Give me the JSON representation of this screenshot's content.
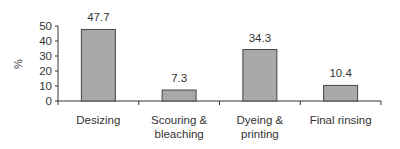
{
  "chart_data": {
    "type": "bar",
    "title": "",
    "xlabel": "",
    "ylabel": "%",
    "ylim": [
      0,
      50
    ],
    "yticks": [
      0,
      10,
      20,
      30,
      40,
      50
    ],
    "grid": false,
    "legend": null,
    "categories": [
      "Desizing",
      "Scouring & bleaching",
      "Dyeing & printing",
      "Final rinsing"
    ],
    "category_lines": [
      [
        "Desizing"
      ],
      [
        "Scouring &",
        "bleaching"
      ],
      [
        "Dyeing &",
        "printing"
      ],
      [
        "Final rinsing"
      ]
    ],
    "values": [
      47.7,
      7.3,
      34.3,
      10.4
    ],
    "value_labels": [
      "47.7",
      "7.3",
      "34.3",
      "10.4"
    ],
    "colors": {
      "bar_fill": "#a9a9a9",
      "bar_stroke": "#444444",
      "axis": "#333333"
    }
  }
}
